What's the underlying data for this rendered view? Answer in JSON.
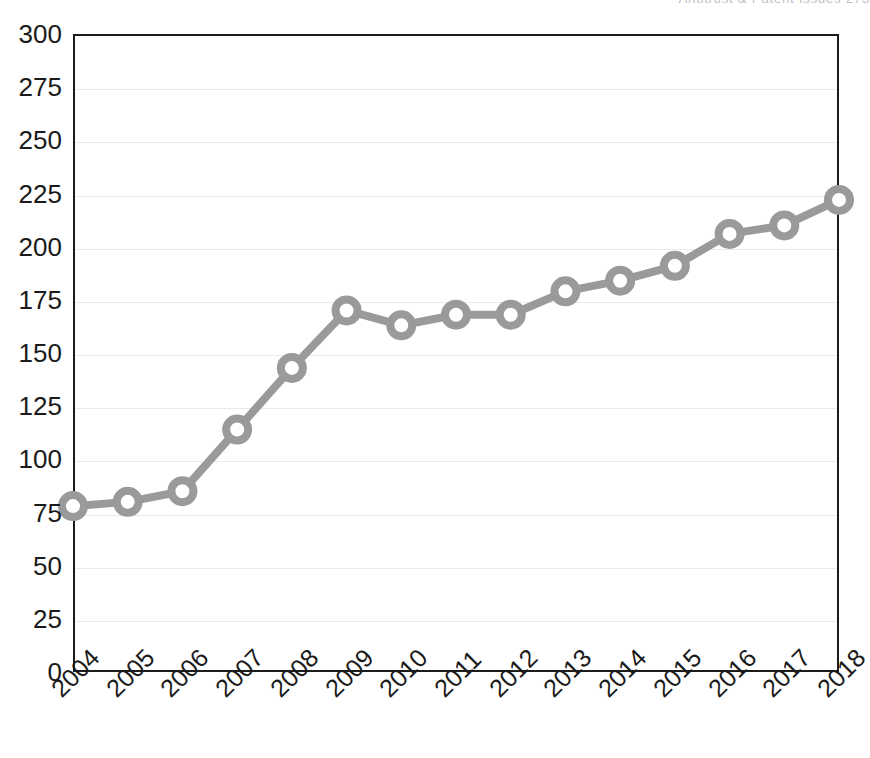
{
  "running_head": {
    "text": "Antitrust & Patent Issues    273"
  },
  "chart_data": {
    "type": "line",
    "title": "",
    "subtitle": "",
    "xlabel": "",
    "ylabel": "",
    "x": [
      2004,
      2005,
      2006,
      2007,
      2008,
      2009,
      2010,
      2011,
      2012,
      2013,
      2014,
      2015,
      2016,
      2017,
      2018
    ],
    "categories": [
      "2004",
      "2005",
      "2006",
      "2007",
      "2008",
      "2009",
      "2010",
      "2011",
      "2012",
      "2013",
      "2014",
      "2015",
      "2016",
      "2017",
      "2018"
    ],
    "values": [
      78,
      80,
      85,
      114,
      143,
      170,
      163,
      168,
      168,
      179,
      184,
      191,
      206,
      210,
      222
    ],
    "series": [
      {
        "name": "",
        "values": [
          78,
          80,
          85,
          114,
          143,
          170,
          163,
          168,
          168,
          179,
          184,
          191,
          206,
          210,
          222
        ]
      }
    ],
    "ylim": [
      0,
      300
    ],
    "ytick_labels": [
      "0",
      "25",
      "50",
      "75",
      "100",
      "125",
      "150",
      "175",
      "200",
      "225",
      "250",
      "275",
      "300"
    ],
    "ytick_values": [
      0,
      25,
      50,
      75,
      100,
      125,
      150,
      175,
      200,
      225,
      250,
      275,
      300
    ],
    "grid": true,
    "grid_axis": "y",
    "legend": false,
    "legend_position": "none",
    "line_color": "#9a9a9a",
    "marker_color": "#9a9a9a",
    "marker_face_color": "#ffffff",
    "marker": "circle",
    "grid_color": "#e9e9ee",
    "axis_color": "#1c1c1c",
    "background_color": "#ffffff",
    "xtick_rotation": -45
  }
}
